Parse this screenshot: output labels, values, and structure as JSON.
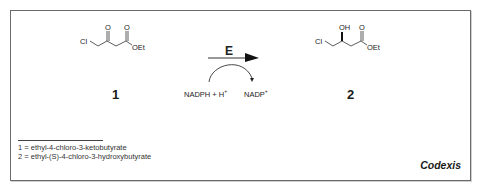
{
  "diagram": {
    "type": "reaction-scheme",
    "reactant": {
      "number": "1",
      "atoms": {
        "cl": "Cl",
        "o1": "O",
        "o2": "O",
        "oet": "OEt"
      }
    },
    "product": {
      "number": "2",
      "atoms": {
        "cl": "Cl",
        "oh": "OH",
        "o": "O",
        "oet": "OEt"
      }
    },
    "arrow": {
      "enzyme_label": "E",
      "cofactor_in": "NADPH + H",
      "cofactor_in_sup": "+",
      "cofactor_out": "NADP",
      "cofactor_out_sup": "+"
    },
    "footnotes": [
      "1 = ethyl-4-chloro-3-ketobutyrate",
      "2 = ethyl-(S)-4-chloro-3-hydroxybutyrate"
    ],
    "brand": "Codexis"
  }
}
